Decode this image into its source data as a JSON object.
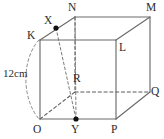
{
  "figure": {
    "kind": "cube-geometry-diagram",
    "width": 164,
    "height": 139,
    "background_color": "#ffffff",
    "line_color": "#6b6b6b",
    "hidden_line_color": "#5a5a5a",
    "label_color": "#2b2b2b",
    "dot_color": "#111111"
  },
  "dimension": {
    "label": "12cm",
    "value": 12,
    "unit": "cm",
    "measures": "edge KO (vertical front-left edge)"
  },
  "labels": {
    "K": "K",
    "L": "L",
    "M": "M",
    "N": "N",
    "O": "O",
    "P": "P",
    "Q": "Q",
    "R": "R",
    "X": "X",
    "Y": "Y"
  },
  "vertices": [
    {
      "name": "K",
      "label": "K",
      "x": 40,
      "y": 40,
      "label_x": 27,
      "label_y": 30,
      "hidden": false,
      "dot": false
    },
    {
      "name": "L",
      "label": "L",
      "x": 116,
      "y": 40,
      "label_x": 119,
      "label_y": 42,
      "hidden": false,
      "dot": false
    },
    {
      "name": "O",
      "label": "O",
      "x": 40,
      "y": 119,
      "label_x": 33,
      "label_y": 124,
      "hidden": false,
      "dot": false
    },
    {
      "name": "P",
      "label": "P",
      "x": 116,
      "y": 119,
      "label_x": 111,
      "label_y": 124,
      "hidden": false,
      "dot": false
    },
    {
      "name": "N",
      "label": "N",
      "x": 75,
      "y": 17,
      "label_x": 69,
      "label_y": 3,
      "hidden": false,
      "dot": false
    },
    {
      "name": "M",
      "label": "M",
      "x": 150,
      "y": 17,
      "label_x": 147,
      "label_y": 3,
      "hidden": false,
      "dot": false
    },
    {
      "name": "Q",
      "label": "Q",
      "x": 150,
      "y": 92,
      "label_x": 151,
      "label_y": 92,
      "hidden": false,
      "dot": false
    },
    {
      "name": "R",
      "label": "R",
      "x": 75,
      "y": 92,
      "label_x": 72,
      "label_y": 74,
      "hidden": true,
      "dot": false
    }
  ],
  "marked_points": [
    {
      "name": "X",
      "label": "X",
      "x": 56,
      "y": 28,
      "label_x": 44,
      "label_y": 16,
      "on_segment": "K-N"
    },
    {
      "name": "Y",
      "label": "Y",
      "x": 76,
      "y": 119,
      "label_x": 71,
      "label_y": 124,
      "on_segment": "O-P"
    }
  ],
  "edges": [
    {
      "name": "edge-K-L",
      "from": "K",
      "to": "L",
      "style": "solid"
    },
    {
      "name": "edge-L-P",
      "from": "L",
      "to": "P",
      "style": "solid"
    },
    {
      "name": "edge-P-O",
      "from": "P",
      "to": "O",
      "style": "solid"
    },
    {
      "name": "edge-O-K",
      "from": "O",
      "to": "K",
      "style": "solid"
    },
    {
      "name": "edge-N-M",
      "from": "N",
      "to": "M",
      "style": "solid"
    },
    {
      "name": "edge-M-Q",
      "from": "M",
      "to": "Q",
      "style": "solid"
    },
    {
      "name": "edge-K-N",
      "from": "K",
      "to": "N",
      "style": "solid"
    },
    {
      "name": "edge-L-M",
      "from": "L",
      "to": "M",
      "style": "solid"
    },
    {
      "name": "edge-P-Q",
      "from": "P",
      "to": "Q",
      "style": "solid"
    },
    {
      "name": "edge-N-R",
      "from": "N",
      "to": "R",
      "style": "hidden"
    },
    {
      "name": "edge-R-Q",
      "from": "R",
      "to": "Q",
      "style": "hidden"
    },
    {
      "name": "edge-O-R",
      "from": "O",
      "to": "R",
      "style": "hidden"
    }
  ],
  "construction_lines": [
    {
      "name": "line-X-Y",
      "from": "X",
      "to": "Y",
      "style": "hidden"
    },
    {
      "name": "line-N-Y",
      "from": "N",
      "to": "Y",
      "style": "hidden"
    }
  ],
  "dimension_arc": {
    "name": "dimension-arc-KO",
    "from": "K",
    "to": "O",
    "style": "hidden",
    "bulge": "left"
  }
}
